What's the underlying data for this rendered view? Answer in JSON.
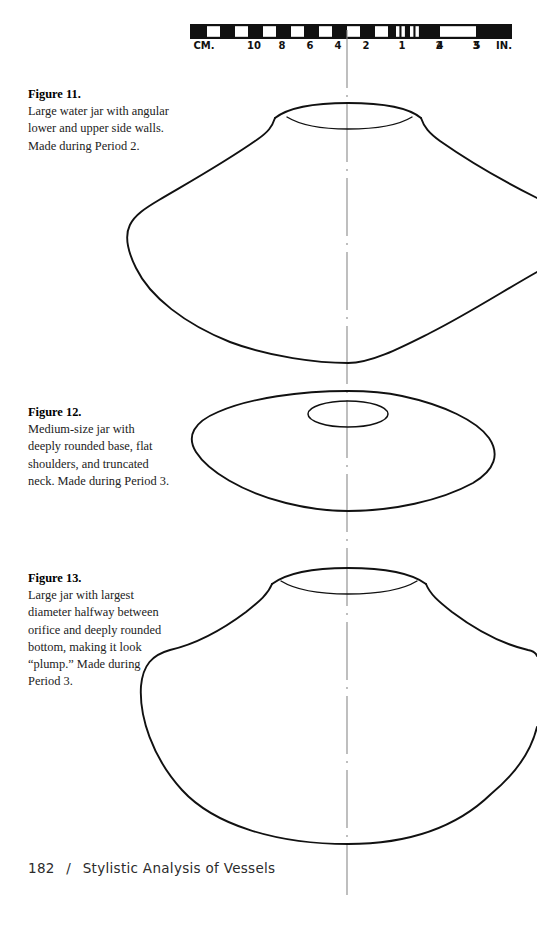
{
  "page": {
    "width": 537,
    "height": 939,
    "background": "#ffffff",
    "ink": "#111111"
  },
  "scale_bar": {
    "name": "archaeological-scale-bar",
    "left_unit_label": "CM.",
    "right_unit_label": "IN.",
    "cm_ticks": [
      "10",
      "8",
      "6",
      "4",
      "2"
    ],
    "in_ticks": [
      "1",
      "2",
      "3",
      "4",
      "5"
    ],
    "labels": [
      {
        "text": "CM.",
        "x": 14
      },
      {
        "text": "10",
        "x": 64
      },
      {
        "text": "8",
        "x": 92
      },
      {
        "text": "6",
        "x": 120
      },
      {
        "text": "4",
        "x": 148
      },
      {
        "text": "2",
        "x": 176
      },
      {
        "text": "1",
        "x": 240
      },
      {
        "text": "2",
        "x": 268
      },
      {
        "text": "3",
        "x": 305
      },
      {
        "text": "4",
        "x": 342
      },
      {
        "text": "5",
        "x": 378
      },
      {
        "text": "IN.",
        "x": 312
      }
    ]
  },
  "figures": [
    {
      "id": "figure-11",
      "number": "Figure 11.",
      "text": "Large water jar with angular lower and upper side walls. Made during Period 2.",
      "vessel_name": "large-water-jar"
    },
    {
      "id": "figure-12",
      "number": "Figure 12.",
      "text": "Medium-size jar with deeply rounded base, flat shoulders, and truncated neck. Made during Period 3.",
      "vessel_name": "medium-size-jar"
    },
    {
      "id": "figure-13",
      "number": "Figure 13.",
      "text": "Large jar with largest diameter halfway between orifice and deeply rounded bottom, making it look “plump.” Made during Period 3.",
      "vessel_name": "large-plump-jar"
    }
  ],
  "footer": {
    "page_number": "182",
    "separator": "/",
    "section_title": "Stylistic Analysis of Vessels"
  }
}
